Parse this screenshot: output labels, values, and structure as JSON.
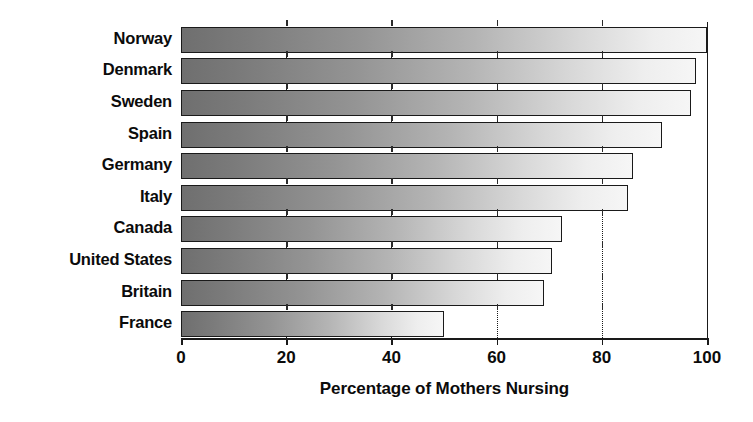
{
  "chart_data": {
    "type": "bar",
    "orientation": "horizontal",
    "title": "",
    "xlabel": "Percentage of Mothers Nursing",
    "ylabel": "",
    "categories": [
      "Norway",
      "Denmark",
      "Sweden",
      "Spain",
      "Germany",
      "Italy",
      "Canada",
      "United States",
      "Britain",
      "France"
    ],
    "values": [
      100,
      98,
      97,
      91.5,
      86,
      85,
      72.5,
      70.5,
      69,
      50
    ],
    "xlim": [
      0,
      100
    ],
    "xticks": [
      0,
      20,
      40,
      60,
      80,
      100
    ],
    "xtick_labels": [
      "0",
      "20",
      "40",
      "60",
      "80",
      "100"
    ],
    "gridlines": {
      "dotted_at": [
        20,
        40,
        60,
        80
      ],
      "solid_at": [
        100
      ]
    },
    "legend": null,
    "bar_style": {
      "fill": "horizontal gradient dark-gray to white",
      "gradient_start_color": "#6f6f6f",
      "gradient_end_color": "#f6f6f6",
      "border_color": "#1a1a1a",
      "shadow_color": "#c9c9c9"
    },
    "axis_color": "#1a1a1a",
    "text_color": "#0b0b0b",
    "background_color": "#ffffff"
  }
}
